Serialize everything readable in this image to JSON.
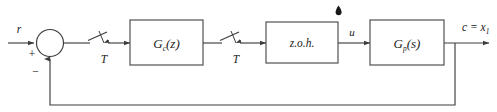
{
  "diagram": {
    "type": "control-system-block-diagram",
    "stroke_color": "#3d3d3d",
    "text_color": "#1a1a1a",
    "background_color": "#ffffff",
    "signals": {
      "reference_input": "r",
      "plus_sign": "+",
      "minus_sign": "−",
      "control_signal": "u",
      "output": "c = x",
      "output_subscript": "1",
      "sampler_period_1": "T",
      "sampler_period_2": "T"
    },
    "blocks": [
      {
        "id": "controller",
        "label_main": "G",
        "label_sub": "c",
        "label_arg": "(z)",
        "full_label": "G_c(z)"
      },
      {
        "id": "zero-order-hold",
        "label_main": "z.o.h.",
        "full_label": "z.o.h."
      },
      {
        "id": "plant",
        "label_main": "G",
        "label_sub": "p",
        "label_arg": "(s)",
        "full_label": "G_p(s)"
      }
    ],
    "annotations": {
      "pointer_marker": "▲"
    }
  }
}
